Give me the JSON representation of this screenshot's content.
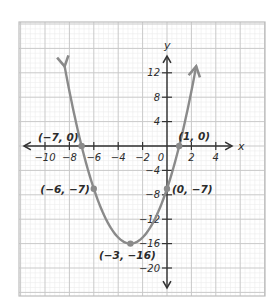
{
  "chart_data": {
    "type": "line",
    "title": "",
    "function": "y = x^2 + 6x - 7",
    "xlabel": "x",
    "ylabel": "y",
    "xlim": [
      -12,
      6.2
    ],
    "ylim": [
      -24,
      20
    ],
    "grid": true,
    "legend": null,
    "x_ticks": [
      -10,
      -8,
      -6,
      -4,
      -2,
      0,
      2,
      4
    ],
    "x_tick_labels": [
      "-10",
      "-8",
      "-6",
      "-4",
      "-2",
      "0",
      "2",
      "4"
    ],
    "y_ticks": [
      12,
      8,
      4,
      -4,
      -8,
      -12,
      -16,
      -20
    ],
    "y_tick_labels": [
      "12",
      "8",
      "4",
      "-4",
      "-8",
      "-12",
      "-16",
      "-20"
    ],
    "series": [
      {
        "name": "parabola",
        "color": "#8a8a8a",
        "x": [
          -8.39,
          -8,
          -7,
          -6,
          -5,
          -4,
          -3,
          -2,
          -1,
          0,
          1,
          2,
          2.39
        ],
        "y": [
          13,
          9,
          0,
          -7,
          -12,
          -15,
          -16,
          -15,
          -12,
          -7,
          0,
          9,
          13
        ]
      }
    ],
    "labeled_points": [
      {
        "x": -7,
        "y": 0,
        "label": "(−7, 0)"
      },
      {
        "x": 1,
        "y": 0,
        "label": "(1, 0)"
      },
      {
        "x": -6,
        "y": -7,
        "label": "(−6, −7)"
      },
      {
        "x": 0,
        "y": -7,
        "label": "(0, −7)"
      },
      {
        "x": -3,
        "y": -16,
        "label": "(−3, −16)"
      }
    ]
  },
  "colors": {
    "curve": "#8a8a8a",
    "axis": "#333333",
    "grid_major": "#c9c9c9",
    "grid_minor": "#ececec",
    "frame": "#bdbdbd",
    "point": "#8a8a8a"
  },
  "layout": {
    "origin_px": [
      167,
      146
    ],
    "px_per_x_unit": 12.2,
    "px_per_y_unit": 6.1,
    "frame": [
      19,
      22,
      265,
      296
    ]
  }
}
